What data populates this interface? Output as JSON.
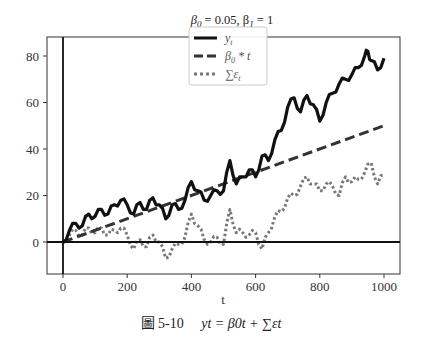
{
  "chart_data": {
    "type": "line",
    "title": "β0 = 0.05, β1 = 1",
    "xlabel": "t",
    "ylabel": "",
    "xlim": [
      -20,
      1040
    ],
    "ylim": [
      -14,
      88
    ],
    "xticks": [
      0,
      200,
      400,
      600,
      800,
      1000
    ],
    "yticks": [
      0,
      20,
      40,
      60,
      80
    ],
    "grid": false,
    "legend_position": "upper center",
    "reference_lines": [
      {
        "orientation": "horizontal",
        "value": 0
      },
      {
        "orientation": "vertical",
        "value": 0
      }
    ],
    "series": [
      {
        "name": "y_t",
        "style": "solid",
        "color": "#111111",
        "x": [
          0,
          20,
          40,
          60,
          80,
          100,
          120,
          140,
          160,
          180,
          200,
          220,
          240,
          260,
          280,
          300,
          320,
          340,
          360,
          380,
          400,
          420,
          440,
          460,
          480,
          500,
          520,
          540,
          560,
          580,
          600,
          620,
          640,
          660,
          680,
          700,
          720,
          740,
          760,
          780,
          800,
          820,
          840,
          860,
          880,
          900,
          920,
          940,
          950,
          960,
          980,
          1000
        ],
        "values": [
          0,
          5,
          8,
          7,
          12,
          11,
          14,
          12,
          16,
          18,
          16,
          12,
          17,
          14,
          19,
          16,
          10,
          16,
          14,
          18,
          26,
          22,
          18,
          20,
          22,
          22,
          35,
          25,
          28,
          31,
          28,
          37,
          35,
          44,
          48,
          58,
          62,
          56,
          63,
          59,
          52,
          60,
          64,
          68,
          70,
          72,
          75,
          80,
          82,
          78,
          74,
          79
        ]
      },
      {
        "name": "β0 * t",
        "style": "dashed",
        "color": "#333333",
        "x": [
          0,
          1000
        ],
        "values": [
          0,
          50
        ]
      },
      {
        "name": "Σε_t",
        "style": "dotted",
        "color": "#777777",
        "x": [
          0,
          20,
          40,
          60,
          80,
          100,
          120,
          140,
          160,
          180,
          200,
          220,
          240,
          260,
          280,
          300,
          320,
          340,
          360,
          380,
          400,
          420,
          440,
          460,
          480,
          500,
          520,
          540,
          560,
          580,
          600,
          620,
          640,
          660,
          680,
          700,
          720,
          740,
          760,
          780,
          800,
          820,
          840,
          860,
          880,
          900,
          920,
          940,
          960,
          980,
          1000
        ],
        "values": [
          0,
          3,
          5,
          3,
          6,
          4,
          6,
          3,
          5,
          6,
          3,
          -3,
          1,
          -2,
          3,
          0,
          -7,
          -3,
          -1,
          2,
          12,
          7,
          1,
          0,
          2,
          -1,
          14,
          4,
          4,
          3,
          4,
          -3,
          4,
          11,
          13,
          19,
          20,
          24,
          28,
          25,
          22,
          25,
          24,
          20,
          28,
          26,
          27,
          30,
          34,
          25,
          29
        ]
      }
    ]
  },
  "title": {
    "prefix": "β",
    "sub0": "0",
    "mid": " = 0.05, β",
    "sub1": "1",
    "suffix": " = 1"
  },
  "legend": {
    "items": [
      {
        "label": "y",
        "sub": "t"
      },
      {
        "label": "β",
        "sub": "0",
        "rest": " * t"
      },
      {
        "label": "∑ε",
        "sub": "t"
      }
    ]
  },
  "axes": {
    "xlabel": "t",
    "xtick_labels": [
      "0",
      "200",
      "400",
      "600",
      "800",
      "1000"
    ],
    "ytick_labels": [
      "0",
      "20",
      "40",
      "60",
      "80"
    ]
  },
  "caption": {
    "fig_label": "圖 5-10",
    "formula": "yt = β0t + ∑εt"
  }
}
